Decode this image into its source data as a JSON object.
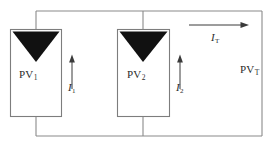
{
  "diagram": {
    "type": "electrical-circuit-schematic",
    "colors": {
      "wire": "#8a8a8a",
      "module_outline": "#7d7d7d",
      "module_fill": "#ffffff",
      "cell_triangle": "#111111",
      "arrow": "#3a3a3a",
      "text": "#2b2b2b",
      "background": "#ffffff"
    },
    "modules": [
      {
        "id": "pv1",
        "label_base": "PV",
        "label_sub": "1",
        "x": 10,
        "y": 29,
        "width": 52,
        "height": 88
      },
      {
        "id": "pv2",
        "label_base": "PV",
        "label_sub": "2",
        "x": 117,
        "y": 29,
        "width": 53,
        "height": 88
      }
    ],
    "currents": [
      {
        "id": "i1",
        "label_base": "I",
        "label_sub": "1",
        "direction": "up",
        "x": 72,
        "y_from": 88,
        "y_to": 58
      },
      {
        "id": "i2",
        "label_base": "I",
        "label_sub": "2",
        "direction": "up",
        "x": 180,
        "y_from": 88,
        "y_to": 58
      },
      {
        "id": "it",
        "label_base": "I",
        "label_sub": "T",
        "direction": "right",
        "y": 25,
        "x_from": 189,
        "x_to": 246
      }
    ],
    "output": {
      "id": "pvt",
      "label_base": "PV",
      "label_sub": "T"
    }
  }
}
